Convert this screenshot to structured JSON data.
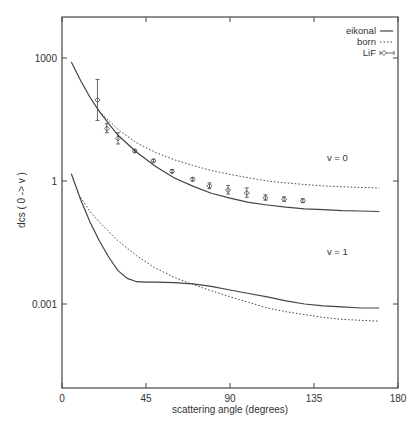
{
  "chart_data": {
    "type": "line",
    "title": "",
    "xlabel": "scattering angle (degrees)",
    "ylabel": "dcs ( 0 -> v )",
    "xlim": [
      0,
      180
    ],
    "ylim_log10": [
      -4.45,
      4.0
    ],
    "yscale": "log",
    "grid": false,
    "legend_position": "upper right",
    "x_ticks": [
      0,
      45,
      90,
      135,
      180
    ],
    "y_ticks": [
      {
        "value": 1000,
        "label": "1000"
      },
      {
        "value": 1,
        "label": "1"
      },
      {
        "value": 0.001,
        "label": "0.001"
      }
    ],
    "legend": [
      {
        "label": "eikonal",
        "style": "solid"
      },
      {
        "label": "born",
        "style": "dotted"
      },
      {
        "label": "LiF",
        "style": "points-errorbars"
      }
    ],
    "annotations": [
      {
        "text": "v = 0",
        "x": 140,
        "y": 3.0
      },
      {
        "text": "v = 1",
        "x": 140,
        "y": 0.016
      }
    ],
    "series": [
      {
        "name": "eikonal v=0",
        "style": "solid",
        "x": [
          5,
          10,
          15,
          20,
          25,
          30,
          40,
          50,
          60,
          70,
          80,
          90,
          100,
          110,
          120,
          130,
          140,
          150,
          160,
          170
        ],
        "y": [
          800,
          280,
          110,
          50,
          25,
          13,
          5,
          2.3,
          1.2,
          0.75,
          0.5,
          0.38,
          0.3,
          0.26,
          0.23,
          0.21,
          0.2,
          0.19,
          0.185,
          0.18
        ]
      },
      {
        "name": "born v=0",
        "style": "dotted",
        "x": [
          20,
          25,
          30,
          40,
          50,
          60,
          70,
          80,
          90,
          100,
          110,
          120,
          130,
          140,
          150,
          160,
          170
        ],
        "y": [
          50,
          30,
          18,
          8.5,
          5,
          3.3,
          2.4,
          1.8,
          1.45,
          1.2,
          1.0,
          0.9,
          0.82,
          0.76,
          0.72,
          0.7,
          0.68
        ]
      },
      {
        "name": "eikonal v=1",
        "style": "solid",
        "x": [
          5,
          10,
          15,
          20,
          25,
          30,
          35,
          40,
          45,
          50,
          60,
          70,
          80,
          90,
          100,
          110,
          120,
          130,
          140,
          150,
          160,
          170
        ],
        "y": [
          1.5,
          0.35,
          0.1,
          0.035,
          0.014,
          0.0065,
          0.0042,
          0.0035,
          0.0034,
          0.0034,
          0.0033,
          0.0031,
          0.0027,
          0.0022,
          0.0018,
          0.0015,
          0.0012,
          0.001,
          0.0009,
          0.00085,
          0.0008,
          0.0008
        ]
      },
      {
        "name": "born v=1",
        "style": "dotted",
        "x": [
          10,
          15,
          20,
          30,
          40,
          50,
          60,
          70,
          80,
          90,
          100,
          110,
          120,
          130,
          140,
          150,
          160,
          170
        ],
        "y": [
          0.4,
          0.18,
          0.1,
          0.035,
          0.015,
          0.0075,
          0.0045,
          0.003,
          0.0021,
          0.0015,
          0.0011,
          0.0008,
          0.00065,
          0.00055,
          0.00047,
          0.00042,
          0.0004,
          0.00038
        ]
      },
      {
        "name": "LiF",
        "style": "points-errorbars",
        "x": [
          19,
          24,
          30,
          39,
          49,
          59,
          70,
          79,
          89,
          99,
          109,
          119,
          129
        ],
        "y": [
          95,
          19,
          11,
          5.4,
          3.1,
          1.7,
          1.1,
          0.76,
          0.6,
          0.51,
          0.39,
          0.36,
          0.33
        ],
        "yerr_low": [
          30,
          15,
          8,
          5.0,
          2.9,
          1.6,
          1.0,
          0.65,
          0.48,
          0.4,
          0.34,
          0.32,
          0.3
        ],
        "yerr_high": [
          300,
          25,
          15,
          5.8,
          3.4,
          1.9,
          1.2,
          0.9,
          0.78,
          0.68,
          0.46,
          0.41,
          0.37
        ]
      }
    ]
  }
}
